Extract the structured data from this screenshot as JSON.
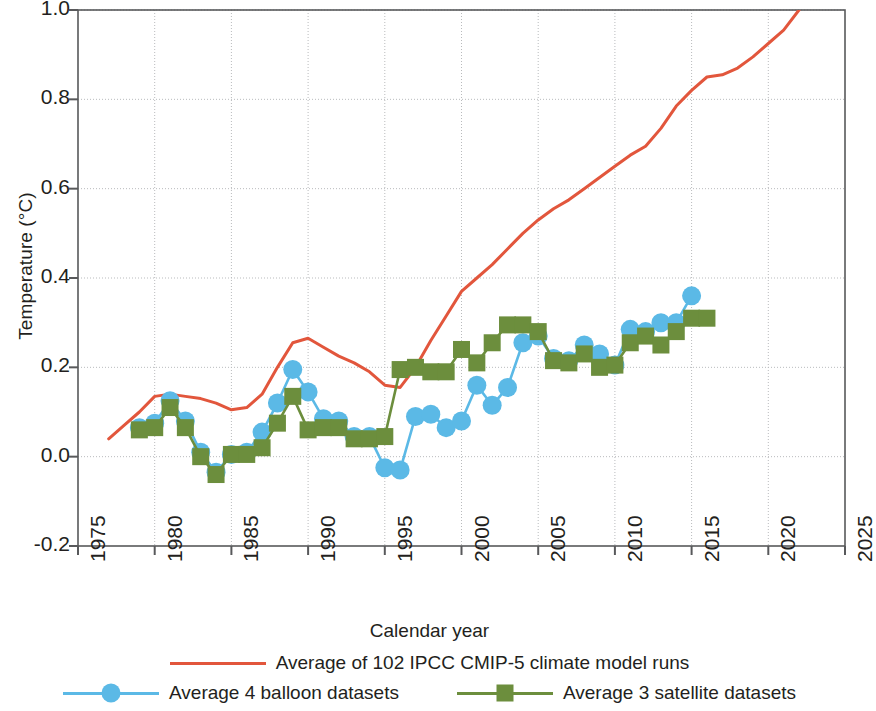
{
  "chart_data": {
    "type": "line",
    "title": "",
    "xlabel": "Calendar year",
    "ylabel": "Temperature (°C)",
    "xlim": [
      1975,
      2025
    ],
    "ylim": [
      -0.2,
      1.0
    ],
    "xticks": [
      1975,
      1980,
      1985,
      1990,
      1995,
      2000,
      2005,
      2010,
      2015,
      2020,
      2025
    ],
    "yticks": [
      "1.0",
      "0.8",
      "0.6",
      "0.4",
      "0.2",
      "0.0",
      "-0.2"
    ],
    "ytick_values": [
      1.0,
      0.8,
      0.6,
      0.4,
      0.2,
      0.0,
      -0.2
    ],
    "grid": true,
    "legend_position": "below",
    "series": [
      {
        "name": "Average of 102 IPCC CMIP-5 climate model runs",
        "color": "#e2563c",
        "marker": "none",
        "x": [
          1977,
          1978,
          1979,
          1980,
          1981,
          1982,
          1983,
          1984,
          1985,
          1986,
          1987,
          1988,
          1989,
          1990,
          1991,
          1992,
          1993,
          1994,
          1995,
          1996,
          1997,
          1998,
          1999,
          2000,
          2001,
          2002,
          2003,
          2004,
          2005,
          2006,
          2007,
          2008,
          2009,
          2010,
          2011,
          2012,
          2013,
          2014,
          2015,
          2016,
          2017,
          2018,
          2019,
          2020,
          2021,
          2022
        ],
        "values": [
          0.04,
          0.07,
          0.1,
          0.135,
          0.14,
          0.135,
          0.13,
          0.12,
          0.105,
          0.11,
          0.14,
          0.2,
          0.255,
          0.265,
          0.245,
          0.225,
          0.21,
          0.19,
          0.16,
          0.155,
          0.2,
          0.26,
          0.315,
          0.37,
          0.4,
          0.43,
          0.465,
          0.5,
          0.53,
          0.555,
          0.575,
          0.6,
          0.625,
          0.65,
          0.675,
          0.695,
          0.735,
          0.785,
          0.82,
          0.85,
          0.855,
          0.87,
          0.895,
          0.925,
          0.955,
          1.0
        ]
      },
      {
        "name": "Average 4 balloon datasets",
        "color": "#5bb9e6",
        "marker": "circle",
        "x": [
          1979,
          1980,
          1981,
          1982,
          1983,
          1984,
          1985,
          1986,
          1987,
          1988,
          1989,
          1990,
          1991,
          1992,
          1993,
          1994,
          1995,
          1996,
          1997,
          1998,
          1999,
          2000,
          2001,
          2002,
          2003,
          2004,
          2005,
          2006,
          2007,
          2008,
          2009,
          2010,
          2011,
          2012,
          2013,
          2014,
          2015
        ],
        "values": [
          0.065,
          0.075,
          0.125,
          0.08,
          0.01,
          -0.035,
          0.005,
          0.01,
          0.055,
          0.12,
          0.195,
          0.145,
          0.085,
          0.08,
          0.045,
          0.045,
          -0.025,
          -0.03,
          0.09,
          0.095,
          0.065,
          0.08,
          0.16,
          0.115,
          0.155,
          0.255,
          0.27,
          0.22,
          0.215,
          0.25,
          0.23,
          0.205,
          0.285,
          0.28,
          0.3,
          0.3,
          0.36
        ]
      },
      {
        "name": "Average 3 satellite datasets",
        "color": "#6c8e3d",
        "marker": "square",
        "x": [
          1979,
          1980,
          1981,
          1982,
          1983,
          1984,
          1985,
          1986,
          1987,
          1988,
          1989,
          1990,
          1991,
          1992,
          1993,
          1994,
          1995,
          1996,
          1997,
          1998,
          1999,
          2000,
          2001,
          2002,
          2003,
          2004,
          2005,
          2006,
          2007,
          2008,
          2009,
          2010,
          2011,
          2012,
          2013,
          2014,
          2015,
          2016
        ],
        "values": [
          0.06,
          0.065,
          0.11,
          0.065,
          0.0,
          -0.04,
          0.005,
          0.005,
          0.02,
          0.075,
          0.135,
          0.06,
          0.065,
          0.065,
          0.04,
          0.04,
          0.045,
          0.195,
          0.2,
          0.19,
          0.19,
          0.24,
          0.21,
          0.255,
          0.295,
          0.295,
          0.28,
          0.215,
          0.21,
          0.23,
          0.2,
          0.205,
          0.255,
          0.27,
          0.25,
          0.28,
          0.31,
          0.31
        ]
      }
    ]
  },
  "axis": {
    "xlabel": "Calendar year",
    "ylabel": "Temperature (°C)"
  },
  "legend": {
    "row1": {
      "label": "Average of 102 IPCC CMIP-5 climate model runs"
    },
    "row2a": {
      "label": "Average 4 balloon datasets"
    },
    "row2b": {
      "label": "Average 3 satellite datasets"
    }
  },
  "colors": {
    "model": "#e2563c",
    "balloon": "#5bb9e6",
    "satellite": "#6c8e3d",
    "axis": "#58595b",
    "grid": "#b9bbbd",
    "text": "#231f20"
  }
}
